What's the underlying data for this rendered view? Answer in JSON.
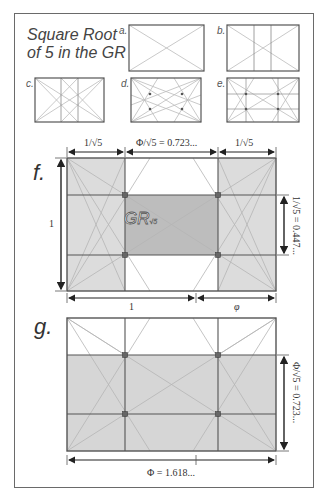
{
  "title": {
    "line1": "Square Root",
    "line2": "of 5 in the GR"
  },
  "thumbnails": [
    {
      "label": "a.",
      "description": "golden rectangle with two diagonals"
    },
    {
      "label": "b.",
      "description": "golden rectangle with diagonals and two vertical lines"
    },
    {
      "label": "c.",
      "description": "golden rectangle with two verticals and diagonals of sub-rectangles"
    },
    {
      "label": "d.",
      "description": "golden rectangle with diagonals crossing, four intersection points"
    },
    {
      "label": "e.",
      "description": "golden rectangle with grid and four intersection points"
    }
  ],
  "diagram_f": {
    "label": "f.",
    "top_dims": [
      "1/√5",
      "Φ/√5 = 0.723...",
      "1/√5"
    ],
    "left_dim": "1",
    "right_dim": "1/√5 = 0.447...",
    "bottom_dims": [
      "1",
      "φ"
    ],
    "center_label": "GR",
    "center_sub": "√5"
  },
  "diagram_g": {
    "label": "g.",
    "right_dim": "Φ/√5 = 0.723...",
    "bottom_dim": "Φ = 1.618..."
  },
  "colors": {
    "frame": "#6a6a6a",
    "line": "#555555",
    "diag": "#b5b5b5",
    "shade_light": "#dcdcdc",
    "shade_dark": "#bdbdbd",
    "arrow": "#222222"
  }
}
